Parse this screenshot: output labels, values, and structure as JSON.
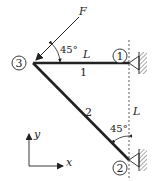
{
  "diagram": {
    "type": "truss",
    "nodes": [
      {
        "id": "1",
        "label": "1"
      },
      {
        "id": "2",
        "label": "2"
      },
      {
        "id": "3",
        "label": "3"
      }
    ],
    "members": [
      {
        "id": "1",
        "label": "1",
        "from": "3",
        "to": "1",
        "length_label": "L"
      },
      {
        "id": "2",
        "label": "2",
        "from": "3",
        "to": "2"
      }
    ],
    "force": {
      "label": "F",
      "angle_label": "45°"
    },
    "angle_at_node2": "45°",
    "vertical_dimension_label": "L",
    "axes": {
      "x": "x",
      "y": "y"
    },
    "colors": {
      "line": "#222222",
      "hatch": "#555555",
      "background": "#ffffff"
    }
  }
}
